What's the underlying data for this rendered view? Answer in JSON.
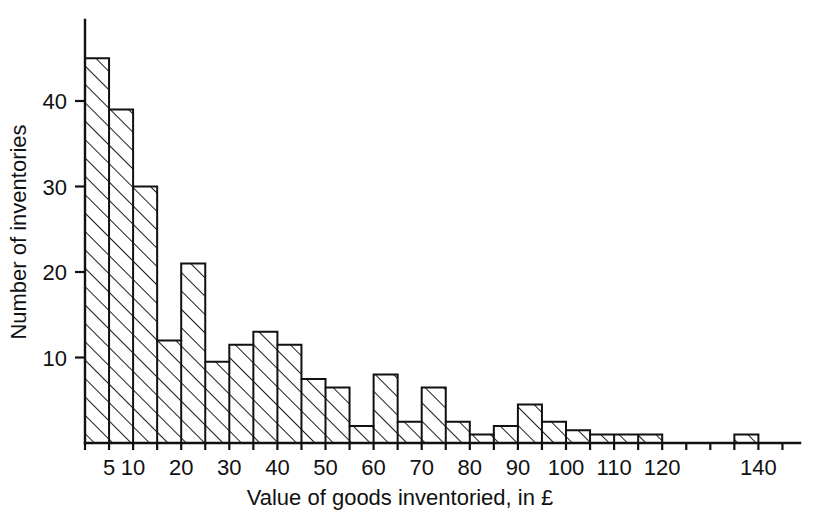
{
  "chart_data": {
    "type": "bar",
    "title": "",
    "subtitle": "",
    "xlabel": "Value of goods inventoried, in £",
    "ylabel": "Number of inventories",
    "xlim": [
      0,
      145
    ],
    "ylim": [
      0,
      48
    ],
    "bin_width": 5,
    "grid": false,
    "legend": null,
    "annotations": [],
    "xticks": [
      5,
      10,
      20,
      30,
      40,
      50,
      60,
      70,
      80,
      90,
      100,
      110,
      120,
      140
    ],
    "xticklabels": [
      "5",
      "10",
      "20",
      "30",
      "40",
      "50",
      "60",
      "70",
      "80",
      "90",
      "100",
      "110",
      "120",
      "140"
    ],
    "xtick_minor": [
      0,
      15,
      25,
      35,
      45,
      55,
      65,
      75,
      85,
      95,
      105,
      115,
      125,
      130,
      135,
      145
    ],
    "yticks": [
      10,
      20,
      30,
      40
    ],
    "yticklabels": [
      "10",
      "20",
      "30",
      "40"
    ],
    "bin_edges": [
      0,
      5,
      10,
      15,
      20,
      25,
      30,
      35,
      40,
      45,
      50,
      55,
      60,
      65,
      70,
      75,
      80,
      85,
      90,
      95,
      100,
      105,
      110,
      115,
      120,
      125,
      130,
      135,
      140
    ],
    "categories": [
      "0-5",
      "5-10",
      "10-15",
      "15-20",
      "20-25",
      "25-30",
      "30-35",
      "35-40",
      "40-45",
      "45-50",
      "50-55",
      "55-60",
      "60-65",
      "65-70",
      "70-75",
      "75-80",
      "80-85",
      "85-90",
      "90-95",
      "95-100",
      "100-105",
      "105-110",
      "110-115",
      "115-120",
      "120-125",
      "125-130",
      "130-135",
      "135-140"
    ],
    "values": [
      45,
      39,
      30,
      12,
      21,
      9.5,
      11.5,
      13,
      11.5,
      7.5,
      6.5,
      2,
      8,
      2.5,
      6.5,
      2.5,
      1,
      2,
      4.5,
      2.5,
      1.5,
      1,
      1,
      1,
      0,
      0,
      0,
      1
    ],
    "series": [
      {
        "name": "Number of inventories",
        "values": [
          45,
          39,
          30,
          12,
          21,
          9.5,
          11.5,
          13,
          11.5,
          7.5,
          6.5,
          2,
          8,
          2.5,
          6.5,
          2.5,
          1,
          2,
          4.5,
          2.5,
          1.5,
          1,
          1,
          1,
          0,
          0,
          0,
          1
        ]
      }
    ],
    "style": {
      "fill": "none",
      "hatch": "diagonal-lines",
      "edge_color": "#111111",
      "background": "#ffffff"
    }
  },
  "axis": {
    "x_title": "Value of goods inventoried, in £",
    "y_title": "Number of inventories"
  },
  "labels": {
    "y": [
      "40",
      "30",
      "20",
      "10"
    ],
    "x": [
      "5",
      "10",
      "20",
      "30",
      "40",
      "50",
      "60",
      "70",
      "80",
      "90",
      "100",
      "110",
      "120",
      "140"
    ]
  }
}
